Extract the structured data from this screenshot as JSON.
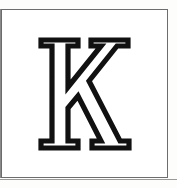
{
  "plate": {
    "background_color": "#ffffff",
    "border_color": "#6d6d6d",
    "caption": ""
  },
  "glyph": {
    "character": "K",
    "style": "outlined serif capital",
    "fill_color": "#ffffff",
    "outline_color": "#111111",
    "alt_text": "Outlined serif capital letter K",
    "bounds": {
      "x": 42,
      "y": 38,
      "width": 95,
      "height": 110
    }
  }
}
